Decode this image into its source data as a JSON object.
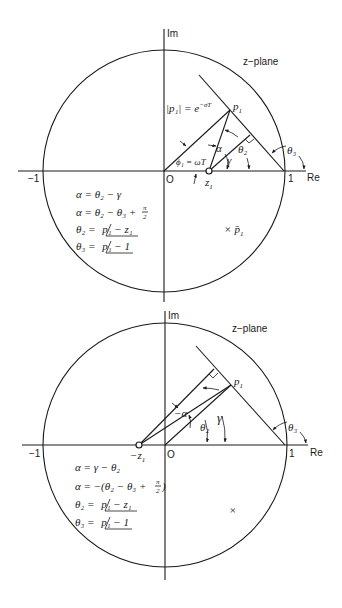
{
  "figure": {
    "panels": [
      {
        "id": "top",
        "axis_labels": {
          "imag": "Im",
          "real": "Re",
          "plane": "z−plane"
        },
        "ticks": {
          "neg_one": "−1",
          "origin": "O",
          "one": "1"
        },
        "points": {
          "pole": "p",
          "pole_sub": "1",
          "zero": "z",
          "zero_sub": "1",
          "conj_pole": "p̄",
          "conj_pole_sub": "1"
        },
        "annotations": {
          "magnitude": "|p₁| = e",
          "magnitude_exp": "−σT",
          "phase": "ϕ₁ = ωT",
          "alpha": "α",
          "gamma": "γ",
          "theta2": "θ₂",
          "theta3": "θ₃"
        },
        "equations": [
          {
            "lhs": "α = θ₂ − γ"
          },
          {
            "lhs": "α = θ₂ − θ₃ + ",
            "frac_num": "π",
            "frac_den": "2"
          },
          {
            "lhs": "θ₂ = ",
            "angle": "p₁ − z₁"
          },
          {
            "lhs": "θ₃ = ",
            "angle": "p₁ − 1"
          }
        ]
      },
      {
        "id": "bottom",
        "axis_labels": {
          "imag": "Im",
          "real": "Re",
          "plane": "z−plane"
        },
        "ticks": {
          "neg_one": "−1",
          "origin": "O",
          "one": "1"
        },
        "points": {
          "pole": "p",
          "pole_sub": "1",
          "zero": "−z",
          "zero_sub": "1",
          "conj_pole": "×"
        },
        "annotations": {
          "alpha": "−α",
          "gamma": "γ",
          "theta2": "θ₂",
          "theta3": "θ₃"
        },
        "equations": [
          {
            "lhs": "α = γ − θ₂"
          },
          {
            "lhs": "α = −(θ₂ − θ₃ + ",
            "frac_num": "π",
            "frac_den": "2",
            "rhs": ")"
          },
          {
            "lhs": "θ₂ = ",
            "angle": "p₁ − z₁"
          },
          {
            "lhs": "θ₃ = ",
            "angle": "p₁ − 1"
          }
        ]
      }
    ]
  }
}
